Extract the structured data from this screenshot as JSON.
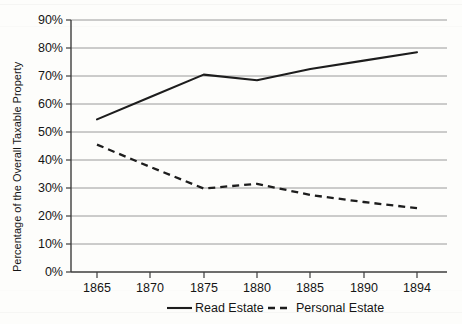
{
  "chart_data": {
    "type": "line",
    "title": "",
    "xlabel": "",
    "ylabel": "Percentage of the Overall Taxable Property",
    "x": [
      1865,
      1870,
      1875,
      1880,
      1885,
      1890,
      1894
    ],
    "xticklabels": [
      "1865",
      "1870",
      "1875",
      "1880",
      "1885",
      "1890",
      "1894"
    ],
    "yticklabels": [
      "0%",
      "10%",
      "20%",
      "30%",
      "40%",
      "50%",
      "60%",
      "70%",
      "80%",
      "90%"
    ],
    "ytickvalues": [
      0,
      10,
      20,
      30,
      40,
      50,
      60,
      70,
      80,
      90
    ],
    "ylim": [
      0,
      90
    ],
    "grid": "horizontal",
    "legend_position": "bottom",
    "series": [
      {
        "name": "Read Estate",
        "style": "solid",
        "color": "#1d1d1d",
        "values": [
          54.5,
          62.5,
          70.5,
          68.5,
          72.5,
          75.5,
          78.5
        ]
      },
      {
        "name": "Personal Estate",
        "style": "dashed",
        "color": "#1d1d1d",
        "values": [
          45.5,
          37.5,
          29.8,
          31.5,
          27.5,
          25.0,
          22.8
        ]
      }
    ]
  },
  "axis": {
    "ylabel": "Percentage of the Overall Taxable Property",
    "yticks": [
      "90%",
      "80%",
      "70%",
      "60%",
      "50%",
      "40%",
      "30%",
      "20%",
      "10%",
      "0%"
    ],
    "xticks": [
      "1865",
      "1870",
      "1875",
      "1880",
      "1885",
      "1890",
      "1894"
    ]
  },
  "legend": {
    "items": [
      {
        "label": "Read Estate",
        "style": "solid"
      },
      {
        "label": "Personal Estate",
        "style": "dashed"
      }
    ]
  }
}
